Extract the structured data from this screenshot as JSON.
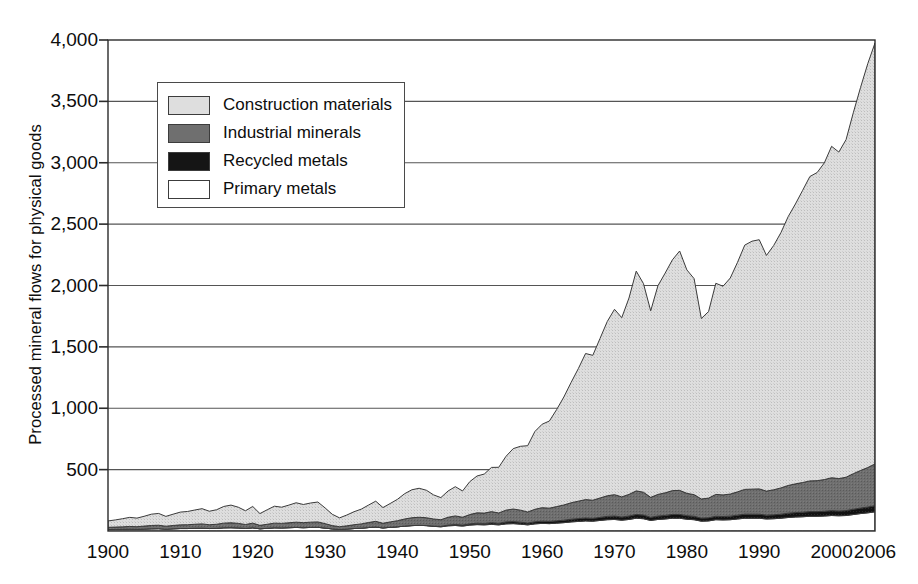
{
  "chart_data": {
    "type": "area",
    "stacked": true,
    "title": "",
    "xlabel": "",
    "ylabel": "Processed mineral flows for physical goods",
    "xlim": [
      1900,
      2006
    ],
    "ylim": [
      0,
      4000
    ],
    "grid": true,
    "legend_position": "upper-left-inside",
    "ytick_labels": [
      "500",
      "1,000",
      "1,500",
      "2,000",
      "2,500",
      "3,000",
      "3,500",
      "4,000"
    ],
    "ytick_values": [
      500,
      1000,
      1500,
      2000,
      2500,
      3000,
      3500,
      4000
    ],
    "xtick_labels": [
      "1900",
      "1910",
      "1920",
      "1930",
      "1940",
      "1950",
      "1960",
      "1970",
      "1980",
      "1990",
      "2000",
      "2006"
    ],
    "xtick_values": [
      1900,
      1910,
      1920,
      1930,
      1940,
      1950,
      1960,
      1970,
      1980,
      1990,
      2000,
      2006
    ],
    "x": [
      1900,
      1901,
      1902,
      1903,
      1904,
      1905,
      1906,
      1907,
      1908,
      1909,
      1910,
      1911,
      1912,
      1913,
      1914,
      1915,
      1916,
      1917,
      1918,
      1919,
      1920,
      1921,
      1922,
      1923,
      1924,
      1925,
      1926,
      1927,
      1928,
      1929,
      1930,
      1931,
      1932,
      1933,
      1934,
      1935,
      1936,
      1937,
      1938,
      1939,
      1940,
      1941,
      1942,
      1943,
      1944,
      1945,
      1946,
      1947,
      1948,
      1949,
      1950,
      1951,
      1952,
      1953,
      1954,
      1955,
      1956,
      1957,
      1958,
      1959,
      1960,
      1961,
      1962,
      1963,
      1964,
      1965,
      1966,
      1967,
      1968,
      1969,
      1970,
      1971,
      1972,
      1973,
      1974,
      1975,
      1976,
      1977,
      1978,
      1979,
      1980,
      1981,
      1982,
      1983,
      1984,
      1985,
      1986,
      1987,
      1988,
      1989,
      1990,
      1991,
      1992,
      1993,
      1994,
      1995,
      1996,
      1997,
      1998,
      1999,
      2000,
      2001,
      2002,
      2003,
      2004,
      2005,
      2006
    ],
    "series": [
      {
        "name": "Primary metals",
        "color": "#ffffff",
        "values": [
          12,
          13,
          14,
          15,
          14,
          16,
          18,
          19,
          15,
          18,
          20,
          20,
          22,
          23,
          20,
          22,
          26,
          27,
          25,
          21,
          26,
          18,
          22,
          26,
          25,
          27,
          29,
          27,
          29,
          30,
          24,
          17,
          13,
          16,
          20,
          23,
          28,
          32,
          25,
          30,
          34,
          40,
          44,
          46,
          44,
          38,
          34,
          42,
          45,
          40,
          48,
          52,
          50,
          54,
          50,
          58,
          60,
          56,
          50,
          58,
          62,
          60,
          64,
          68,
          74,
          78,
          82,
          80,
          86,
          92,
          94,
          88,
          94,
          104,
          100,
          86,
          94,
          98,
          104,
          104,
          96,
          92,
          80,
          82,
          92,
          90,
          92,
          98,
          104,
          104,
          104,
          98,
          100,
          104,
          110,
          114,
          116,
          120,
          120,
          122,
          126,
          124,
          126,
          134,
          142,
          148,
          156
        ]
      },
      {
        "name": "Recycled metals",
        "color": "#111111",
        "values": [
          0,
          0,
          0,
          0,
          0,
          0,
          0,
          0,
          0,
          0,
          0,
          0,
          0,
          0,
          0,
          0,
          0,
          0,
          0,
          0,
          0,
          0,
          0,
          0,
          0,
          0,
          0,
          0,
          0,
          0,
          0,
          0,
          0,
          0,
          0,
          0,
          0,
          0,
          0,
          0,
          0,
          0,
          0,
          0,
          0,
          2,
          4,
          6,
          8,
          8,
          10,
          12,
          12,
          14,
          13,
          16,
          17,
          16,
          15,
          17,
          18,
          18,
          19,
          20,
          22,
          23,
          24,
          23,
          25,
          27,
          28,
          26,
          28,
          31,
          30,
          26,
          28,
          29,
          31,
          31,
          29,
          28,
          25,
          26,
          28,
          28,
          29,
          31,
          33,
          33,
          33,
          31,
          32,
          33,
          35,
          36,
          37,
          38,
          38,
          39,
          40,
          39,
          40,
          43,
          45,
          47,
          50
        ]
      },
      {
        "name": "Industrial minerals",
        "color": "#6e6e6e",
        "values": [
          18,
          19,
          20,
          22,
          21,
          24,
          27,
          28,
          24,
          27,
          30,
          31,
          33,
          35,
          31,
          33,
          38,
          40,
          37,
          32,
          38,
          28,
          33,
          38,
          37,
          40,
          43,
          41,
          43,
          44,
          36,
          27,
          22,
          26,
          31,
          35,
          41,
          47,
          38,
          44,
          50,
          58,
          64,
          66,
          64,
          58,
          54,
          64,
          70,
          64,
          76,
          84,
          84,
          90,
          84,
          96,
          102,
          98,
          90,
          102,
          110,
          108,
          116,
          124,
          134,
          142,
          150,
          148,
          158,
          168,
          174,
          164,
          176,
          192,
          186,
          162,
          176,
          184,
          194,
          196,
          182,
          176,
          156,
          160,
          178,
          176,
          180,
          190,
          202,
          204,
          206,
          196,
          204,
          214,
          226,
          234,
          242,
          250,
          252,
          258,
          268,
          264,
          272,
          290,
          306,
          322,
          340
        ]
      },
      {
        "name": "Construction materials",
        "color": "#d9d9d9",
        "values": [
          52,
          58,
          66,
          74,
          70,
          80,
          92,
          96,
          80,
          92,
          104,
          108,
          116,
          124,
          110,
          118,
          136,
          144,
          132,
          112,
          136,
          96,
          118,
          138,
          132,
          144,
          158,
          148,
          156,
          162,
          128,
          92,
          72,
          88,
          106,
          120,
          142,
          164,
          128,
          150,
          174,
          206,
          228,
          236,
          224,
          196,
          180,
          214,
          238,
          214,
          268,
          300,
          318,
          360,
          372,
          438,
          492,
          520,
          540,
          634,
          680,
          710,
          790,
          880,
          980,
          1080,
          1190,
          1180,
          1300,
          1420,
          1510,
          1460,
          1600,
          1790,
          1700,
          1520,
          1700,
          1790,
          1880,
          1950,
          1820,
          1760,
          1470,
          1520,
          1720,
          1700,
          1760,
          1870,
          1990,
          2020,
          2030,
          1920,
          1990,
          2080,
          2190,
          2280,
          2380,
          2480,
          2510,
          2580,
          2700,
          2660,
          2750,
          2940,
          3120,
          3290,
          3430
        ]
      }
    ],
    "totals_note": "Stacked total rises from about 82 in 1900 to about 3,820 in 2006"
  },
  "legend": {
    "items": [
      {
        "label": "Construction materials",
        "swatch": "construction-materials-swatch"
      },
      {
        "label": "Industrial minerals",
        "swatch": "industrial-minerals-swatch"
      },
      {
        "label": "Recycled metals",
        "swatch": "recycled-metals-swatch"
      },
      {
        "label": "Primary metals",
        "swatch": "primary-metals-swatch"
      }
    ]
  },
  "colors": {
    "construction_materials": "#d9d9d9",
    "industrial_minerals": "#6e6e6e",
    "recycled_metals": "#111111",
    "primary_metals": "#ffffff",
    "axis": "#2b2b2b",
    "grid": "#555555",
    "background": "#ffffff"
  }
}
